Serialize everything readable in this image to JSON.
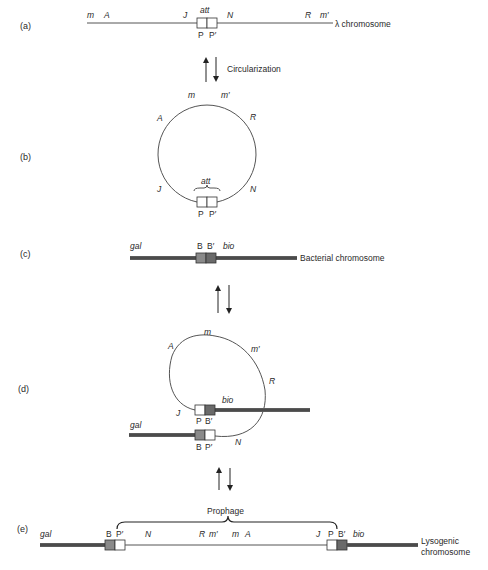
{
  "figure": {
    "panels": {
      "a": {
        "label": "(a)",
        "genes": {
          "m": "m",
          "A": "A",
          "J": "J",
          "N": "N",
          "R": "R",
          "m_prime": "m′"
        },
        "att": "att",
        "P": "P",
        "P_prime": "P′",
        "chromosome_label": "λ chromosome"
      },
      "arrow_ab": {
        "label": "Circularization"
      },
      "b": {
        "label": "(b)",
        "genes": {
          "m": "m",
          "m_prime": "m′",
          "A": "A",
          "R": "R",
          "J": "J",
          "N": "N"
        },
        "att": "att",
        "P": "P",
        "P_prime": "P′"
      },
      "c": {
        "label": "(c)",
        "gal": "gal",
        "B": "B",
        "B_prime": "B′",
        "bio": "bio",
        "chromosome_label": "Bacterial chromosome"
      },
      "d": {
        "label": "(d)",
        "genes": {
          "m": "m",
          "A": "A",
          "m_prime": "m′",
          "R": "R",
          "J": "J",
          "N": "N"
        },
        "bio": "bio",
        "gal": "gal",
        "P": "P",
        "B_prime": "B′",
        "B": "B",
        "P_prime": "P′"
      },
      "e": {
        "label": "(e)",
        "prophage": "Prophage",
        "gal": "gal",
        "B": "B",
        "P_prime": "P′",
        "genes": {
          "N": "N",
          "R": "R",
          "m_prime": "m′",
          "m": "m",
          "A": "A",
          "J": "J"
        },
        "P": "P",
        "B_prime": "B′",
        "bio": "bio",
        "chromosome_label_1": "Lysogenic",
        "chromosome_label_2": "chromosome"
      }
    },
    "colors": {
      "bacterial_dna": "#5c5c5c",
      "B_box": "#8a8a8a",
      "B_prime_box": "#6a6a6a",
      "phage_line": "#555555"
    }
  }
}
